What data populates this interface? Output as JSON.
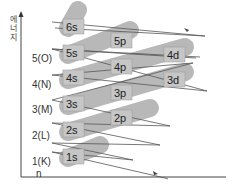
{
  "diagram": {
    "axis_title": [
      "에",
      "너",
      "지"
    ],
    "shells": [
      {
        "label": "5(O)"
      },
      {
        "label": "4(N)"
      },
      {
        "label": "3(M)"
      },
      {
        "label": "2(L)"
      },
      {
        "label": "1(K)"
      }
    ],
    "n_label": "n",
    "orbitals": [
      {
        "name": "6s"
      },
      {
        "name": "5s"
      },
      {
        "name": "4s"
      },
      {
        "name": "3s"
      },
      {
        "name": "2s"
      },
      {
        "name": "1s"
      },
      {
        "name": "5p"
      },
      {
        "name": "4p"
      },
      {
        "name": "3p"
      },
      {
        "name": "2p"
      },
      {
        "name": "4d"
      },
      {
        "name": "3d"
      }
    ],
    "filling_order": [
      "1s",
      "2s",
      "2p",
      "3s",
      "3p",
      "4s",
      "3d",
      "4p",
      "5s",
      "4d",
      "5p",
      "6s"
    ],
    "colors": {
      "band": "#b5b5b5",
      "box": "#c8c8c8",
      "line": "#555555",
      "axis": "#444444"
    }
  }
}
